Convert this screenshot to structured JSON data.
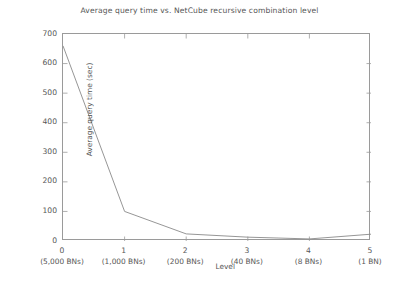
{
  "chart_data": {
    "type": "line",
    "title": "Average query time vs. NetCube recursive combination level",
    "xlabel": "Level",
    "ylabel": "Average query time (sec)",
    "x": [
      0,
      1,
      2,
      3,
      4,
      5
    ],
    "values": [
      660,
      100,
      24,
      13,
      7,
      23
    ],
    "categories": [
      "0",
      "1",
      "2",
      "3",
      "4",
      "5"
    ],
    "x_sublabels": [
      "(5,000 BNs)",
      "(1,000 BNs)",
      "(200 BNs)",
      "(40 BNs)",
      "(8 BNs)",
      "(1 BN)"
    ],
    "xlim": [
      0,
      5
    ],
    "ylim": [
      0,
      700
    ],
    "yticks": [
      0,
      100,
      200,
      300,
      400,
      500,
      600,
      700
    ],
    "ytick_labels": [
      "0",
      "100",
      "200",
      "300",
      "400",
      "500",
      "600",
      "700"
    ],
    "grid": false,
    "legend": null,
    "series": [
      {
        "name": "Average query time",
        "values": [
          660,
          100,
          24,
          13,
          7,
          23
        ],
        "color": "#8a8a8a",
        "marker": "none",
        "line_width": 0.9
      }
    ]
  },
  "style": {
    "frame_color": "#9a9a9a",
    "text_color": "#565656",
    "line_color": "#8a8a8a",
    "background": "#ffffff"
  }
}
